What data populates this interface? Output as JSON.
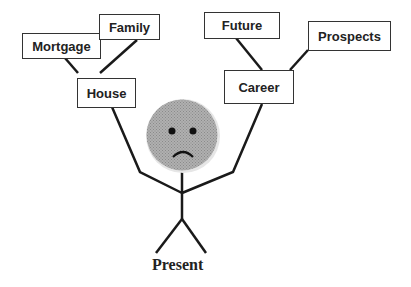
{
  "diagram": {
    "figure": {
      "label": "Present",
      "mood": "sad-face"
    },
    "left_branch": {
      "hub": "House",
      "children": [
        "Mortgage",
        "Family"
      ]
    },
    "right_branch": {
      "hub": "Career",
      "children": [
        "Future",
        "Prospects"
      ]
    },
    "colors": {
      "line": "#1a1a1a",
      "face_fill": "#a6a6a6",
      "box_border": "#333333"
    }
  }
}
